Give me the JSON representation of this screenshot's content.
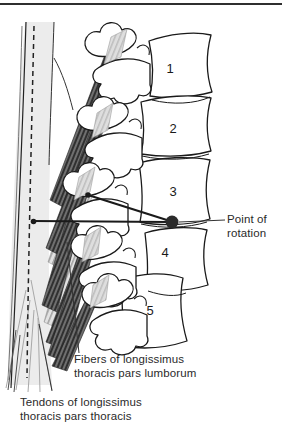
{
  "figure": {
    "type": "anatomical-diagram",
    "vertebrae": [
      {
        "label": "1"
      },
      {
        "label": "2"
      },
      {
        "label": "3"
      },
      {
        "label": "4"
      },
      {
        "label": "5"
      }
    ],
    "labels": {
      "point_of_rotation": "Point of rotation",
      "fibers": "Fibers of longissimus thoracis pars lumborum",
      "tendons": "Tendons of longissimus thoracis pars thoracis"
    },
    "colors": {
      "ink": "#1a1a1a",
      "muscle_dark": "#2a2a2a",
      "muscle_mid": "#9b9b9b",
      "tendon_fill": "#ececec",
      "rotation_dot": "#2b2b2b",
      "top_border": "#2f2f2f"
    }
  }
}
